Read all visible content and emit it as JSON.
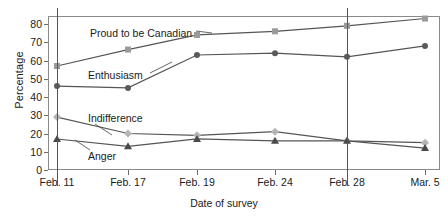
{
  "chart_data": {
    "type": "line",
    "title": "",
    "xlabel": "Date of survey",
    "ylabel": "Percentage",
    "categories": [
      "Feb. 11",
      "Feb. 17",
      "Feb. 19",
      "Feb. 24",
      "Feb. 28",
      "Mar. 5"
    ],
    "ylim": [
      0,
      85
    ],
    "yticks": [
      0,
      10,
      20,
      30,
      40,
      50,
      60,
      70,
      80
    ],
    "grid": false,
    "legend": "inline-labels",
    "reference_lines": [
      "Feb. 11",
      "Feb. 28"
    ],
    "series": [
      {
        "name": "Proud to be Canadian",
        "marker": "square",
        "color": "#9a9a9a",
        "line_color": "#555555",
        "values": [
          57,
          66,
          74,
          76,
          79,
          83
        ],
        "label_x": 90,
        "label_y": 27
      },
      {
        "name": "Enthusiasm",
        "marker": "circle",
        "color": "#5a5a5a",
        "line_color": "#555555",
        "values": [
          46,
          45,
          63,
          64,
          62,
          68
        ],
        "label_x": 88,
        "label_y": 69
      },
      {
        "name": "Indifference",
        "marker": "diamond",
        "color": "#b5b5b5",
        "line_color": "#555555",
        "values": [
          29,
          20,
          19,
          21,
          16,
          15
        ],
        "label_x": 88,
        "label_y": 112
      },
      {
        "name": "Anger",
        "marker": "triangle",
        "color": "#4a4a4a",
        "line_color": "#555555",
        "values": [
          17,
          13,
          17,
          16,
          16,
          12
        ],
        "label_x": 88,
        "label_y": 150
      }
    ]
  }
}
